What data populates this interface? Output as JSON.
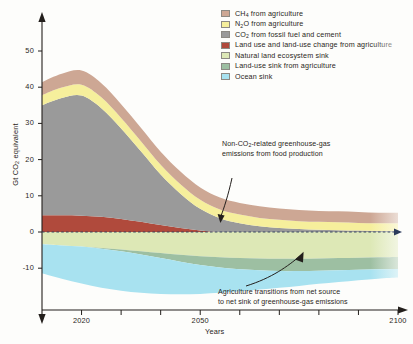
{
  "legend": {
    "items": [
      {
        "label": "CH4 from agriculture",
        "html": "CH<sub>4</sub> from agriculture",
        "color": "#cda794"
      },
      {
        "label": "N2O from agriculture",
        "html": "N<sub>2</sub>O from agriculture",
        "color": "#f6ef9c"
      },
      {
        "label": "CO2 from fossil fuel and cement",
        "html": "CO<sub>2</sub> from fossil fuel and cement",
        "color": "#9a9a9a"
      },
      {
        "label": "Land use and land-use change from agriculture",
        "html": "Land use and land-use change from agriculture",
        "color": "#b04a3c"
      },
      {
        "label": "Natural land ecosystem sink",
        "html": "Natural land ecosystem sink",
        "color": "#dde8b6"
      },
      {
        "label": "Land-use sink from agriculture",
        "html": "Land-use sink from agriculture",
        "color": "#9dbfa2"
      },
      {
        "label": "Ocean sink",
        "html": "Ocean sink",
        "color": "#a8e2f0"
      }
    ]
  },
  "annotations": {
    "non_co2": "Non-CO2-related greenhouse-gas emissions from food production",
    "non_co2_html": "Non-CO<sub>2</sub>-related greenhouse-gas<br>emissions from food production",
    "transition": "Agriculture transitions from net source to net sink of greenhouse-gas emissions",
    "transition_html": "Agriculture transitions from net source<br>to net sink of greenhouse-gas emissions"
  },
  "chart_data": {
    "type": "area",
    "title": "",
    "xlabel": "Years",
    "ylabel": "Gt CO2 equivalent",
    "ylabel_html": "Gt CO<sub>2</sub> equivalent",
    "xlim": [
      2010,
      2100
    ],
    "ylim": [
      -18,
      52
    ],
    "xticks": [
      2020,
      2050,
      2100
    ],
    "xtick_minor": [
      2030,
      2040,
      2060,
      2070,
      2080,
      2090
    ],
    "yticks": [
      -10,
      0,
      10,
      20,
      30,
      40,
      50
    ],
    "grid": false,
    "legend_position": "top-right",
    "zero_line": true,
    "x": [
      2010,
      2015,
      2020,
      2025,
      2030,
      2035,
      2040,
      2045,
      2050,
      2055,
      2060,
      2065,
      2070,
      2075,
      2080,
      2085,
      2090,
      2095,
      2100
    ],
    "series": [
      {
        "name": "Land use and land-use change from agriculture",
        "color": "#b04a3c",
        "stack": "positive",
        "values": [
          4.6,
          4.6,
          4.5,
          4.2,
          3.6,
          2.8,
          1.9,
          1.1,
          0.4,
          0.0,
          0.0,
          0.0,
          0.0,
          0.0,
          0.0,
          0.0,
          0.0,
          0.0,
          0.0
        ]
      },
      {
        "name": "CO2 from fossil fuel and cement",
        "color": "#9a9a9a",
        "stack": "positive",
        "values": [
          30.4,
          32.4,
          33.2,
          30.0,
          25.0,
          19.5,
          14.0,
          9.5,
          6.0,
          3.8,
          2.4,
          1.6,
          1.1,
          0.8,
          0.6,
          0.5,
          0.4,
          0.3,
          0.3
        ]
      },
      {
        "name": "N2O from agriculture",
        "color": "#f6ef9c",
        "stack": "positive",
        "values": [
          2.8,
          2.9,
          3.0,
          3.0,
          2.9,
          2.8,
          2.7,
          2.6,
          2.5,
          2.4,
          2.4,
          2.3,
          2.3,
          2.2,
          2.2,
          2.2,
          2.1,
          2.1,
          2.1
        ]
      },
      {
        "name": "CH4 from agriculture",
        "color": "#cda794",
        "stack": "positive",
        "values": [
          3.6,
          3.8,
          3.9,
          3.9,
          3.8,
          3.7,
          3.6,
          3.5,
          3.4,
          3.3,
          3.2,
          3.2,
          3.1,
          3.1,
          3.0,
          3.0,
          3.0,
          2.9,
          2.9
        ]
      },
      {
        "name": "Natural land ecosystem sink",
        "color": "#dde8b6",
        "stack": "negative",
        "values": [
          -3.4,
          -3.7,
          -4.0,
          -4.4,
          -4.8,
          -5.3,
          -5.8,
          -6.3,
          -6.7,
          -7.0,
          -7.2,
          -7.3,
          -7.4,
          -7.4,
          -7.3,
          -7.2,
          -7.1,
          -7.0,
          -6.9
        ]
      },
      {
        "name": "Land-use sink from agriculture",
        "color": "#9dbfa2",
        "stack": "negative",
        "values": [
          0.0,
          0.0,
          0.0,
          -0.2,
          -0.5,
          -0.9,
          -1.4,
          -1.9,
          -2.4,
          -2.8,
          -3.1,
          -3.3,
          -3.4,
          -3.4,
          -3.4,
          -3.4,
          -3.3,
          -3.3,
          -3.3
        ]
      },
      {
        "name": "Ocean sink",
        "color": "#a8e2f0",
        "stack": "negative",
        "values": [
          -8.0,
          -9.2,
          -10.2,
          -10.8,
          -10.9,
          -10.6,
          -9.9,
          -9.0,
          -8.0,
          -7.0,
          -6.1,
          -5.3,
          -4.6,
          -4.1,
          -3.6,
          -3.2,
          -2.9,
          -2.6,
          -2.4
        ]
      }
    ],
    "peak": {
      "year": 2021,
      "total": 44.5
    }
  }
}
